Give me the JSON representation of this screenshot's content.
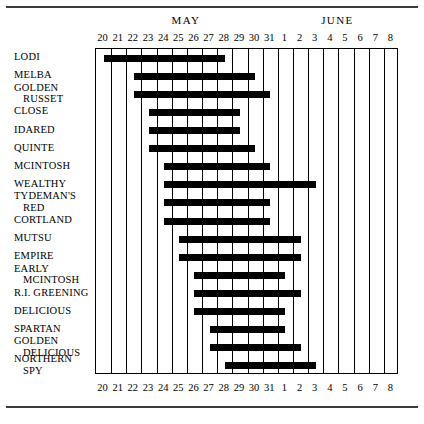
{
  "chart_data": {
    "type": "bar",
    "orientation": "horizontal-range",
    "title": "",
    "xlabel": "",
    "ylabel": "",
    "grid": true,
    "legend": null,
    "months": [
      {
        "label": "MAY",
        "start_day": 20,
        "end_day": 31
      },
      {
        "label": "JUNE",
        "start_day": 1,
        "end_day": 8
      }
    ],
    "x_tick_labels": [
      "20",
      "21",
      "22",
      "23",
      "24",
      "25",
      "26",
      "27",
      "28",
      "29",
      "30",
      "31",
      "1",
      "2",
      "3",
      "4",
      "5",
      "6",
      "7",
      "8"
    ],
    "x_tick_index": [
      0,
      1,
      2,
      3,
      4,
      5,
      6,
      7,
      8,
      9,
      10,
      11,
      12,
      13,
      14,
      15,
      16,
      17,
      18,
      19
    ],
    "xlim_index": [
      0,
      19
    ],
    "categories": [
      "LODI",
      "MELBA",
      "GOLDEN RUSSET",
      "CLOSE",
      "IDARED",
      "QUINTE",
      "MCINTOSH",
      "WEALTHY",
      "TYDEMAN'S RED",
      "CORTLAND",
      "MUTSU",
      "EMPIRE",
      "EARLY MCINTOSH",
      "R.I. GREENING",
      "DELICIOUS",
      "SPARTAN",
      "GOLDEN DELICIOUS",
      "NORTHERN SPY"
    ],
    "bars": [
      {
        "name": "LODI",
        "start_label": "May 20",
        "end_label": "May 28",
        "start_index": 0,
        "end_index": 8
      },
      {
        "name": "MELBA",
        "start_label": "May 22",
        "end_label": "May 30",
        "start_index": 2,
        "end_index": 10
      },
      {
        "name": "GOLDEN RUSSET",
        "start_label": "May 22",
        "end_label": "May 31",
        "start_index": 2,
        "end_index": 11
      },
      {
        "name": "CLOSE",
        "start_label": "May 23",
        "end_label": "May 29",
        "start_index": 3,
        "end_index": 9
      },
      {
        "name": "IDARED",
        "start_label": "May 23",
        "end_label": "May 29",
        "start_index": 3,
        "end_index": 9
      },
      {
        "name": "QUINTE",
        "start_label": "May 23",
        "end_label": "May 30",
        "start_index": 3,
        "end_index": 10
      },
      {
        "name": "MCINTOSH",
        "start_label": "May 24",
        "end_label": "May 31",
        "start_index": 4,
        "end_index": 11
      },
      {
        "name": "WEALTHY",
        "start_label": "May 24",
        "end_label": "June 3",
        "start_index": 4,
        "end_index": 14
      },
      {
        "name": "TYDEMAN'S RED",
        "start_label": "May 24",
        "end_label": "May 31",
        "start_index": 4,
        "end_index": 11
      },
      {
        "name": "CORTLAND",
        "start_label": "May 24",
        "end_label": "May 31",
        "start_index": 4,
        "end_index": 11
      },
      {
        "name": "MUTSU",
        "start_label": "May 25",
        "end_label": "June 2",
        "start_index": 5,
        "end_index": 13
      },
      {
        "name": "EMPIRE",
        "start_label": "May 25",
        "end_label": "June 2",
        "start_index": 5,
        "end_index": 13
      },
      {
        "name": "EARLY MCINTOSH",
        "start_label": "May 26",
        "end_label": "June 1",
        "start_index": 6,
        "end_index": 12
      },
      {
        "name": "R.I. GREENING",
        "start_label": "May 26",
        "end_label": "June 2",
        "start_index": 6,
        "end_index": 13
      },
      {
        "name": "DELICIOUS",
        "start_label": "May 26",
        "end_label": "June 1",
        "start_index": 6,
        "end_index": 12
      },
      {
        "name": "SPARTAN",
        "start_label": "May 27",
        "end_label": "June 1",
        "start_index": 7,
        "end_index": 12
      },
      {
        "name": "GOLDEN DELICIOUS",
        "start_label": "May 27",
        "end_label": "June 2",
        "start_index": 7,
        "end_index": 13
      },
      {
        "name": "NORTHERN SPY",
        "start_label": "May 28",
        "end_label": "June 3",
        "start_index": 8,
        "end_index": 14
      }
    ],
    "bar_color": "#000000"
  },
  "row_labels": [
    {
      "line1": "LODI",
      "line2": ""
    },
    {
      "line1": "MELBA",
      "line2": ""
    },
    {
      "line1": "GOLDEN",
      "line2": "RUSSET"
    },
    {
      "line1": "CLOSE",
      "line2": ""
    },
    {
      "line1": "IDARED",
      "line2": ""
    },
    {
      "line1": "QUINTE",
      "line2": ""
    },
    {
      "line1": "MCINTOSH",
      "line2": ""
    },
    {
      "line1": "WEALTHY",
      "line2": ""
    },
    {
      "line1": "TYDEMAN'S",
      "line2": "RED"
    },
    {
      "line1": "CORTLAND",
      "line2": ""
    },
    {
      "line1": "MUTSU",
      "line2": ""
    },
    {
      "line1": "EMPIRE",
      "line2": ""
    },
    {
      "line1": "EARLY",
      "line2": "MCINTOSH"
    },
    {
      "line1": "R.I. GREENING",
      "line2": ""
    },
    {
      "line1": "DELICIOUS",
      "line2": ""
    },
    {
      "line1": "SPARTAN",
      "line2": ""
    },
    {
      "line1": "GOLDEN",
      "line2": "DELICIOUS"
    },
    {
      "line1": "NORTHERN",
      "line2": "SPY"
    }
  ]
}
